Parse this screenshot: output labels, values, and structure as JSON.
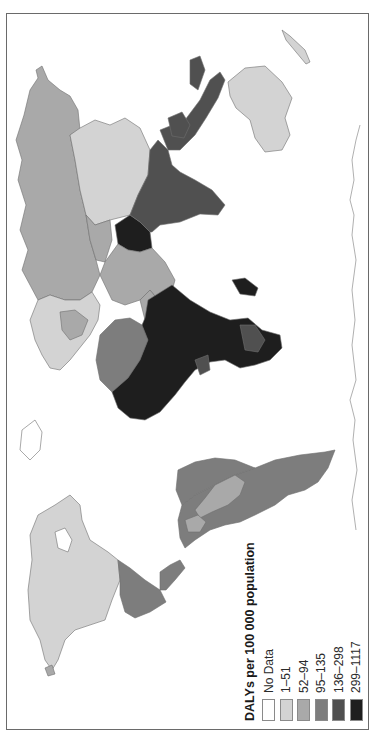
{
  "map": {
    "title": "DALYs per 100 000 population",
    "orientation": "rotated 90° counter-clockwise",
    "frame_color": "#6a6a6a",
    "border_color": "#6e6e6e"
  },
  "legend": {
    "title": "DALYs per 100 000 population",
    "items": [
      {
        "label": "No Data",
        "color": "#ffffff"
      },
      {
        "label": "1–51",
        "color": "#d3d3d3"
      },
      {
        "label": "52–94",
        "color": "#a9a9a9"
      },
      {
        "label": "95–135",
        "color": "#7d7d7d"
      },
      {
        "label": "136–298",
        "color": "#505050"
      },
      {
        "label": "299–1117",
        "color": "#1e1e1e"
      }
    ]
  },
  "regions": [
    {
      "name": "Russia",
      "class": "52–94"
    },
    {
      "name": "China",
      "class": "1–51"
    },
    {
      "name": "Mongolia/Kazakhstan",
      "class": "52–94"
    },
    {
      "name": "India",
      "class": "136–298"
    },
    {
      "name": "Southeast Asia",
      "class": "136–298"
    },
    {
      "name": "Pakistan/Afghanistan",
      "class": "299–1117"
    },
    {
      "name": "Middle East",
      "class": "52–94"
    },
    {
      "name": "Europe",
      "class": "1–51"
    },
    {
      "name": "Sub-Saharan Africa",
      "class": "299–1117"
    },
    {
      "name": "North Africa",
      "class": "95–135"
    },
    {
      "name": "Madagascar",
      "class": "299–1117"
    },
    {
      "name": "Australia",
      "class": "1–51"
    },
    {
      "name": "USA/Canada",
      "class": "1–51"
    },
    {
      "name": "Mexico/Central America",
      "class": "95–135"
    },
    {
      "name": "South America",
      "class": "95–135"
    },
    {
      "name": "Argentina/Chile",
      "class": "52–94"
    },
    {
      "name": "Greenland",
      "class": "No Data"
    },
    {
      "name": "Antarctica",
      "class": "No Data"
    }
  ]
}
